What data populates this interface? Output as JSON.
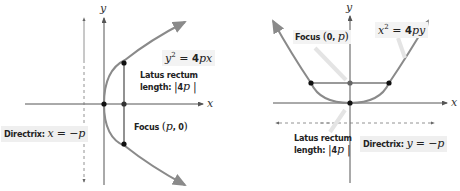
{
  "colors": {
    "curve": "#8a8a8a",
    "axis": "#555555",
    "point": "#111111",
    "label_bg": "#efefef",
    "text": "#222222"
  },
  "left_panel": {
    "type": "horizontal parabola (opens right)",
    "x_axis_label": "x",
    "y_axis_label": "y",
    "equation": {
      "lhs_var": "y",
      "lhs_exp": "2",
      "eq": " = ",
      "coef": "4",
      "rhs_vars": "px"
    },
    "latus_rectum": {
      "line1": "Latus rectum",
      "line2_prefix": "length: ",
      "value_open": "|",
      "value_coef": "4",
      "value_var": "p",
      "value_close": " |"
    },
    "focus": {
      "prefix": "Focus ",
      "open": "(",
      "var": "p",
      "sep": ", ",
      "zero": "0",
      "close": ")"
    },
    "directrix": {
      "prefix": "Directrix: ",
      "var": "x",
      "eq": " = −",
      "rhs": "p"
    },
    "points": [
      "vertex",
      "focus",
      "latus-top",
      "latus-bottom"
    ]
  },
  "right_panel": {
    "type": "vertical parabola (opens up)",
    "x_axis_label": "x",
    "y_axis_label": "y",
    "equation": {
      "lhs_var": "x",
      "lhs_exp": "2",
      "eq": " = ",
      "coef": "4",
      "rhs_vars": "py"
    },
    "latus_rectum": {
      "line1": "Latus rectum",
      "line2_prefix": "length: ",
      "value_open": "|",
      "value_coef": "4",
      "value_var": "p",
      "value_close": " |"
    },
    "focus": {
      "prefix": "Focus ",
      "open": "(",
      "zero": "0",
      "sep": ", ",
      "var": "p",
      "close": ")"
    },
    "directrix": {
      "prefix": "Directrix: ",
      "var": "y",
      "eq": " = −",
      "rhs": "p"
    },
    "points": [
      "vertex",
      "focus",
      "latus-left",
      "latus-right"
    ]
  }
}
